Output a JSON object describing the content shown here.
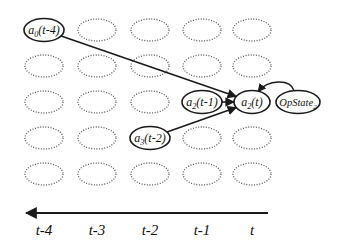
{
  "diagram": {
    "type": "temporal dependency grid",
    "grid": {
      "rows": 5,
      "columns": 5,
      "column_centers_x": [
        44,
        97,
        150,
        202,
        252
      ],
      "row_centers_y": [
        30,
        66,
        102,
        138,
        174
      ],
      "ellipse_rx": 19,
      "ellipse_ry": 11,
      "placeholder_style": "dotted"
    },
    "nodes": [
      {
        "id": "a0_t-4",
        "base": "a",
        "sub": "0",
        "arg": "(t-4)",
        "col": 0,
        "row": 0
      },
      {
        "id": "a2_t-1",
        "base": "a",
        "sub": "2",
        "arg": "(t-1)",
        "col": 3,
        "row": 2
      },
      {
        "id": "a2_t",
        "base": "a",
        "sub": "2",
        "arg": "(t)",
        "col": 4,
        "row": 2
      },
      {
        "id": "a3_t-2",
        "base": "a",
        "sub": "3",
        "arg": "(t-2)",
        "col": 2,
        "row": 3
      },
      {
        "id": "opstate2",
        "base": "OpState",
        "sub": "2",
        "arg": "",
        "x": 298,
        "y": 102
      }
    ],
    "edges": [
      {
        "from": "a0_t-4",
        "to": "a2_t"
      },
      {
        "from": "a2_t-1",
        "to": "a2_t"
      },
      {
        "from": "a3_t-2",
        "to": "a2_t"
      },
      {
        "from": "opstate2",
        "to": "a2_t",
        "curved": true
      }
    ],
    "time_axis": {
      "direction": "left",
      "labels": [
        "t-4",
        "t-3",
        "t-2",
        "t-1",
        "t"
      ]
    },
    "colors": {
      "stroke": "#1a1a1a",
      "dotted": "#555555",
      "background": "#ffffff"
    }
  }
}
